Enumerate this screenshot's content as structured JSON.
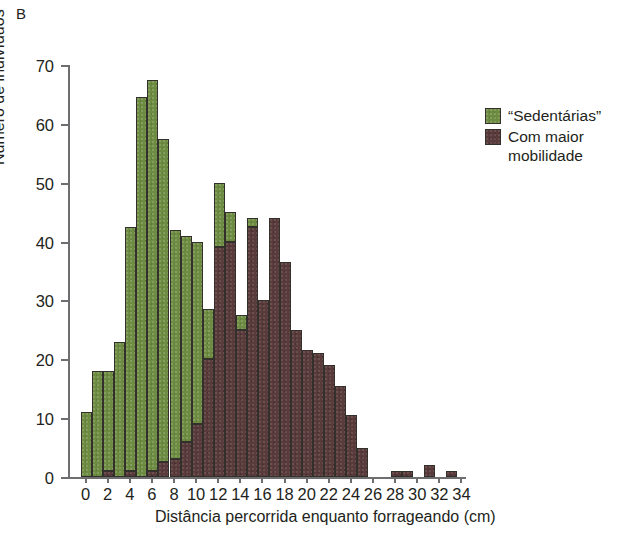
{
  "figure": {
    "panel_label": "B"
  },
  "legend": {
    "position": "right",
    "entries": [
      {
        "label": "“Sedentárias”",
        "color": "#6d8b41",
        "icon": "legend-swatch-green"
      },
      {
        "label": "Com maior mobilidade",
        "color": "#5a3b3b",
        "icon": "legend-swatch-brown"
      }
    ]
  },
  "chart_data": {
    "type": "bar",
    "subtype": "stacked-histogram",
    "title": "",
    "panel_label": "B",
    "xlabel": "Distância percorrida enquanto forrageando (cm)",
    "ylabel": "Número de indivíduos",
    "xlim": [
      -1,
      35
    ],
    "ylim": [
      0,
      70
    ],
    "xticks": [
      0,
      2,
      4,
      6,
      8,
      10,
      12,
      14,
      16,
      18,
      20,
      22,
      24,
      26,
      28,
      30,
      32,
      34
    ],
    "yticks": [
      0,
      10,
      20,
      30,
      40,
      50,
      60,
      70
    ],
    "xtick_labels": [
      "0",
      "2",
      "4",
      "6",
      "8",
      "10",
      "12",
      "14",
      "16",
      "18",
      "20",
      "22",
      "24",
      "26",
      "28",
      "30",
      "32",
      "34"
    ],
    "ytick_labels": [
      "0",
      "10",
      "20",
      "30",
      "40",
      "50",
      "60",
      "70"
    ],
    "grid": false,
    "bin_width": 1,
    "x": [
      0,
      1,
      2,
      3,
      4,
      5,
      6,
      7,
      8,
      9,
      10,
      11,
      12,
      13,
      14,
      15,
      16,
      17,
      18,
      19,
      20,
      21,
      22,
      23,
      24,
      25,
      26,
      27,
      28,
      29,
      30,
      31,
      32,
      33,
      34
    ],
    "series": [
      {
        "name": "“Sedentárias”",
        "color": "#6d8b41",
        "values": [
          11,
          18,
          17,
          23,
          41.5,
          64.5,
          66.5,
          55,
          39,
          35,
          31,
          8.5,
          11,
          5,
          2.5,
          1.5,
          0,
          0,
          0,
          0,
          0,
          0,
          0,
          0,
          0,
          0,
          0,
          0,
          0,
          0,
          0,
          0,
          0,
          0,
          0
        ]
      },
      {
        "name": "Com maior mobilidade",
        "color": "#5a3b3b",
        "values": [
          0,
          0,
          1,
          0,
          1,
          0,
          1,
          2.5,
          3,
          6,
          9,
          20,
          39,
          40,
          25,
          42.5,
          30,
          44,
          36.5,
          25,
          21.5,
          21,
          19,
          15.5,
          10.5,
          5,
          0,
          0,
          1,
          1,
          0,
          2,
          0,
          1,
          0
        ]
      }
    ]
  }
}
